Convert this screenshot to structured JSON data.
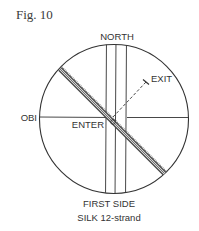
{
  "figure": {
    "caption": "Fig. 10",
    "labels": {
      "north": "NORTH",
      "exit": "EXIT",
      "obi": "OBI",
      "enter": "ENTER",
      "first_side": "FIRST SIDE",
      "material": "SILK 12-strand"
    },
    "colors": {
      "line": "#333333",
      "band": "#555555",
      "background": "#ffffff"
    }
  }
}
